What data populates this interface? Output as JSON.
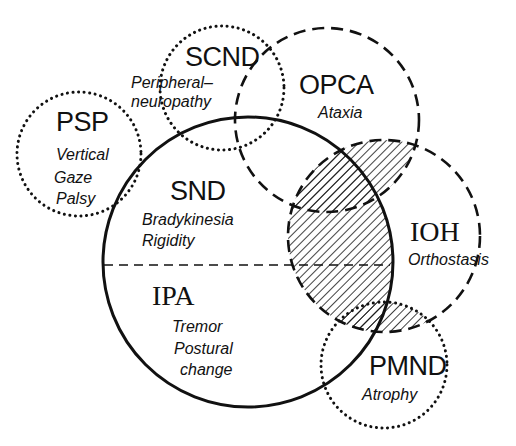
{
  "diagram": {
    "type": "venn",
    "colors": {
      "ink": "#111111",
      "background": "#ffffff"
    },
    "sets": [
      {
        "id": "psp",
        "abbr": "PSP",
        "lines": [
          "Vertical",
          "Gaze",
          "Palsy"
        ],
        "border": "dotted"
      },
      {
        "id": "scnd",
        "abbr": "SCND",
        "lines": [
          "Peripheral–",
          "neuropathy"
        ],
        "border": "dotted"
      },
      {
        "id": "opca",
        "abbr": "OPCA",
        "lines": [
          "Ataxia"
        ],
        "border": "dashed"
      },
      {
        "id": "snd",
        "abbr": "SND",
        "lines": [
          "Bradykinesia",
          "Rigidity"
        ],
        "border": "solid-upper-half"
      },
      {
        "id": "ipa",
        "abbr": "IPA",
        "lines": [
          "Tremor",
          "Postural",
          "change"
        ],
        "border": "solid-lower-half"
      },
      {
        "id": "ioh",
        "abbr": "IOH",
        "lines": [
          "Orthostasis"
        ],
        "border": "dashed"
      },
      {
        "id": "pmnd",
        "abbr": "PMND",
        "lines": [
          "Atrophy"
        ],
        "border": "dotted"
      }
    ],
    "divider": "dashed horizontal line separating SND (upper) from IPA (lower)",
    "shaded_region": "hatched overlap of IOH with OPCA, SND/IPA and PMND"
  }
}
